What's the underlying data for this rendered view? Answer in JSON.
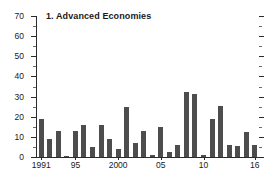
{
  "chart_data": {
    "type": "bar",
    "title": "1. Advanced Economies",
    "xlabel": "",
    "ylabel": "",
    "ylim": [
      0,
      70
    ],
    "ytick_step": 10,
    "yminor_step": 5,
    "grid": false,
    "legend": null,
    "bar_color": "#4d4d4d",
    "axis_color": "#2b2b2b",
    "background": "#ffffff",
    "ytick_labels": [
      "70",
      "60",
      "50",
      "40",
      "30",
      "20",
      "10",
      "0"
    ],
    "ytick_values": [
      70,
      60,
      50,
      40,
      30,
      20,
      10,
      0
    ],
    "xtick_labels": [
      "1991",
      "95",
      "2000",
      "05",
      "10",
      "16"
    ],
    "xtick_years": [
      1991,
      1995,
      2000,
      2005,
      2010,
      2016
    ],
    "categories": [
      "1991",
      "1992",
      "1993",
      "1994",
      "1995",
      "1996",
      "1997",
      "1998",
      "1999",
      "2000",
      "2001",
      "2002",
      "2003",
      "2004",
      "2005",
      "2006",
      "2007",
      "2008",
      "2009",
      "2010",
      "2011",
      "2012",
      "2013",
      "2014",
      "2015",
      "2016"
    ],
    "values": [
      19,
      9,
      13,
      0.7,
      13,
      16,
      5,
      16,
      9,
      4,
      25,
      7,
      13,
      1,
      15,
      2.5,
      6,
      32.5,
      31.5,
      1,
      19,
      25.5,
      6,
      5.5,
      12.5,
      6
    ],
    "x_start": 1991,
    "x_end": 2016
  }
}
